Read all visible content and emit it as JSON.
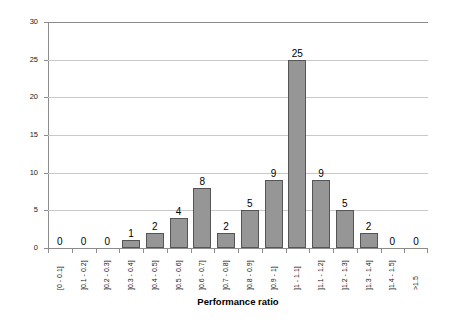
{
  "chart_data": {
    "type": "bar",
    "title": "",
    "xlabel": "Performance ratio",
    "ylabel": "Number of experiments",
    "categories": [
      "[0 - 0.1]",
      "]0.1 - 0.2]",
      "]0.2 - 0.3]",
      "]0.3 - 0.4]",
      "]0.4 - 0.5]",
      "]0.5 - 0.6]",
      "]0.6 - 0.7]",
      "]0.7 - 0.8]",
      "]0.8 - 0.9]",
      "]0.9 - 1]",
      "]1 - 1.1]",
      "]1.1 - 1.2]",
      "]1.2 - 1.3]",
      "]1.3 - 1.4]",
      "]1.4 - 1.5]",
      ">1.5"
    ],
    "values": [
      0,
      0,
      0,
      1,
      2,
      4,
      8,
      2,
      5,
      9,
      25,
      9,
      5,
      2,
      0,
      0
    ],
    "data_labels": [
      "0",
      "0",
      "0",
      "1",
      "2",
      "4",
      "8",
      "2",
      "5",
      "9",
      "25",
      "9",
      "5",
      "2",
      "0",
      "0"
    ],
    "ylim": [
      0,
      30
    ],
    "yticks": [
      0,
      5,
      10,
      15,
      20,
      25,
      30
    ],
    "ytick_labels": [
      "0",
      "5",
      "10",
      "15",
      "20",
      "25",
      "30"
    ],
    "grid": "horizontal",
    "legend": "none",
    "bar_color": "#969696",
    "bar_border_color": "#555555",
    "gridline_color": "#c9c9c9",
    "axis_color": "#8c8c8c",
    "background_color": "#ffffff"
  }
}
